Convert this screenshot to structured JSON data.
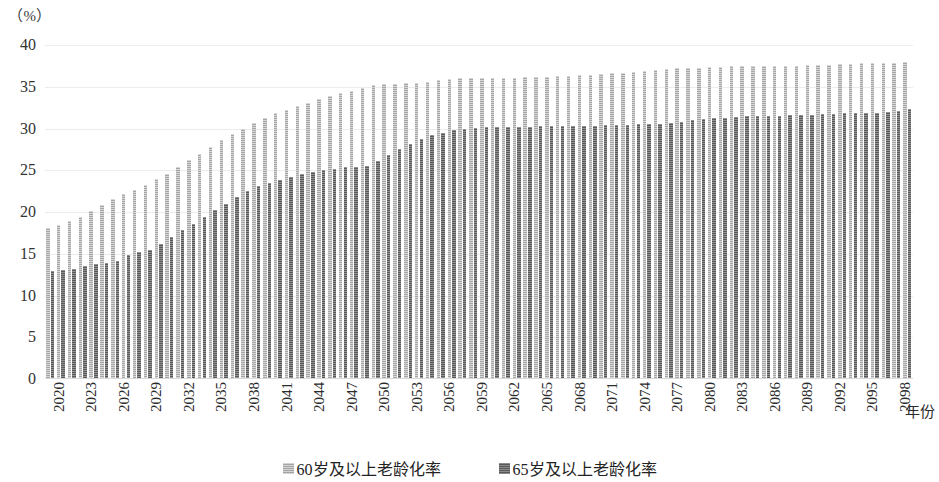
{
  "axis": {
    "unit_label": "（%）",
    "x_axis_title": "年份",
    "y_ticks": [
      "40",
      "35",
      "30",
      "25",
      "20",
      "15",
      "10",
      "5",
      "0"
    ]
  },
  "legend": {
    "items": [
      {
        "label": "60岁及以上老龄化率",
        "color": "#a6a6a6"
      },
      {
        "label": "65岁及以上老龄化率",
        "color": "#595959"
      }
    ]
  },
  "chart_data": {
    "type": "bar",
    "title": "",
    "xlabel": "年份",
    "ylabel": "（%）",
    "ylim": [
      0,
      40
    ],
    "ytick_step": 5,
    "grid": true,
    "legend_position": "bottom",
    "x_tick_interval": 3,
    "categories": [
      "2020",
      "2021",
      "2022",
      "2023",
      "2024",
      "2025",
      "2026",
      "2027",
      "2028",
      "2029",
      "2030",
      "2031",
      "2032",
      "2033",
      "2034",
      "2035",
      "2036",
      "2037",
      "2038",
      "2039",
      "2040",
      "2041",
      "2042",
      "2043",
      "2044",
      "2045",
      "2046",
      "2047",
      "2048",
      "2049",
      "2050",
      "2051",
      "2052",
      "2053",
      "2054",
      "2055",
      "2056",
      "2057",
      "2058",
      "2059",
      "2060",
      "2061",
      "2062",
      "2063",
      "2064",
      "2065",
      "2066",
      "2067",
      "2068",
      "2069",
      "2070",
      "2071",
      "2072",
      "2073",
      "2074",
      "2075",
      "2076",
      "2077",
      "2078",
      "2079",
      "2080",
      "2081",
      "2082",
      "2083",
      "2084",
      "2085",
      "2086",
      "2087",
      "2088",
      "2089",
      "2090",
      "2091",
      "2092",
      "2093",
      "2094",
      "2095",
      "2096",
      "2097",
      "2098",
      "2099"
    ],
    "tick_labels": [
      "2020",
      "2023",
      "2026",
      "2029",
      "2032",
      "2035",
      "2038",
      "2041",
      "2044",
      "2047",
      "2050",
      "2053",
      "2056",
      "2059",
      "2062",
      "2065",
      "2068",
      "2071",
      "2074",
      "2077",
      "2080",
      "2083",
      "2086",
      "2089",
      "2092",
      "2095",
      "2098"
    ],
    "series": [
      {
        "name": "60岁及以上老龄化率",
        "color": "#a6a6a6",
        "values": [
          18.1,
          18.4,
          18.9,
          19.4,
          20.1,
          20.9,
          21.6,
          22.1,
          22.6,
          23.2,
          23.9,
          24.6,
          25.4,
          26.2,
          27.0,
          27.8,
          28.6,
          29.3,
          30.0,
          30.7,
          31.3,
          31.8,
          32.2,
          32.7,
          33.1,
          33.5,
          33.9,
          34.2,
          34.5,
          34.9,
          35.2,
          35.3,
          35.3,
          35.4,
          35.5,
          35.6,
          35.8,
          35.9,
          36.0,
          36.0,
          36.0,
          36.0,
          36.0,
          36.1,
          36.2,
          36.2,
          36.2,
          36.3,
          36.3,
          36.4,
          36.4,
          36.5,
          36.6,
          36.7,
          36.8,
          36.9,
          37.0,
          37.1,
          37.2,
          37.3,
          37.3,
          37.4,
          37.4,
          37.5,
          37.5,
          37.5,
          37.5,
          37.5,
          37.5,
          37.5,
          37.6,
          37.6,
          37.6,
          37.7,
          37.7,
          37.8,
          37.8,
          37.9,
          37.9,
          38.0
        ]
      },
      {
        "name": "65岁及以上老龄化率",
        "color": "#595959",
        "values": [
          12.9,
          13.0,
          13.2,
          13.5,
          13.8,
          13.9,
          14.1,
          14.8,
          15.2,
          15.4,
          16.2,
          17.0,
          17.9,
          18.6,
          19.4,
          20.3,
          21.0,
          21.8,
          22.5,
          23.1,
          23.5,
          23.8,
          24.2,
          24.5,
          24.8,
          25.0,
          25.2,
          25.4,
          25.4,
          25.5,
          26.1,
          26.8,
          27.5,
          28.2,
          28.8,
          29.2,
          29.5,
          29.8,
          30.0,
          30.1,
          30.2,
          30.2,
          30.2,
          30.2,
          30.2,
          30.3,
          30.3,
          30.3,
          30.3,
          30.3,
          30.3,
          30.4,
          30.4,
          30.4,
          30.5,
          30.5,
          30.6,
          30.7,
          30.8,
          31.0,
          31.1,
          31.2,
          31.3,
          31.4,
          31.5,
          31.5,
          31.5,
          31.5,
          31.6,
          31.6,
          31.6,
          31.7,
          31.7,
          31.8,
          31.8,
          31.9,
          31.9,
          32.0,
          32.1,
          32.3
        ]
      }
    ]
  }
}
